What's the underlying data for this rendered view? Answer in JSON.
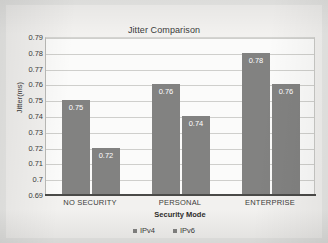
{
  "chart_data": {
    "type": "bar",
    "title": "Jitter Comparison",
    "xlabel": "Security Mode",
    "ylabel": "Jitter(ms)",
    "categories": [
      "NO SECURITY",
      "PERSONAL",
      "ENTERPRISE"
    ],
    "series": [
      {
        "name": "IPv4",
        "values": [
          0.75,
          0.76,
          0.78
        ],
        "color": "#828281"
      },
      {
        "name": "IPv6",
        "values": [
          0.72,
          0.74,
          0.76
        ],
        "color": "#828281"
      }
    ],
    "value_labels": [
      [
        "0.75",
        "0.76",
        "0.78"
      ],
      [
        "0.72",
        "0.74",
        "0.76"
      ]
    ],
    "ylim": [
      0.69,
      0.79
    ],
    "ytick_step": 0.01,
    "yticks": [
      "0.79",
      "0.78",
      "0.77",
      "0.76",
      "0.75",
      "0.74",
      "0.73",
      "0.72",
      "0.71",
      "0.7",
      "0.69"
    ],
    "grid": true,
    "legend_position": "bottom",
    "legend": [
      "IPv4",
      "IPv6"
    ]
  },
  "colors": {
    "bar": "#828281",
    "page_background": "#e8e8e6",
    "plot_background": "#fbfbfa",
    "gridline": "#cfcfcc",
    "axis": "#4a4a48",
    "value_label": "#ffffff",
    "text": "#3c3c3a"
  }
}
